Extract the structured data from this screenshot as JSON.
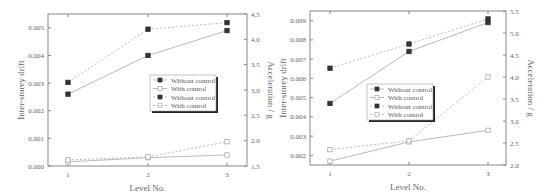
{
  "chart_data": [
    {
      "type": "line",
      "categories": [
        1,
        2,
        3
      ],
      "xlabel": "Level No.",
      "ylabel": "Inter-storey drift",
      "y2label": "Acceleration / g",
      "ylim": [
        0.0,
        0.0055
      ],
      "y2lim": [
        1.5,
        4.5
      ],
      "yticks": [
        "0.000",
        "0.001",
        "0.002",
        "0.003",
        "0.004",
        "0.005"
      ],
      "y2ticks": [
        "1.5",
        "2.0",
        "2.5",
        "3.0",
        "3.5",
        "4.0",
        "4.5"
      ],
      "xticks": [
        "1",
        "2",
        "3"
      ],
      "grid": false,
      "legend_position": "center-right",
      "series": [
        {
          "name": "Without control",
          "axis": "left",
          "style": "solid",
          "marker": "filled-square",
          "values": [
            0.0026,
            0.004,
            0.0049
          ]
        },
        {
          "name": "With control",
          "axis": "left",
          "style": "solid",
          "marker": "open-square",
          "values": [
            0.00015,
            0.0003,
            0.0004
          ]
        },
        {
          "name": "Without control",
          "axis": "right",
          "style": "dashed",
          "marker": "filled-square",
          "values": [
            3.15,
            4.2,
            4.33
          ]
        },
        {
          "name": "With control",
          "axis": "right",
          "style": "dashed",
          "marker": "open-square",
          "values": [
            1.62,
            1.68,
            1.98
          ]
        }
      ]
    },
    {
      "type": "line",
      "categories": [
        1,
        2,
        3
      ],
      "xlabel": "Level No.",
      "ylabel": "Inter-storey drift",
      "y2label": "Acceleration / g",
      "ylim": [
        0.0015,
        0.0095
      ],
      "y2lim": [
        2.0,
        5.5
      ],
      "yticks": [
        "0.002",
        "0.003",
        "0.004",
        "0.005",
        "0.006",
        "0.007",
        "0.008",
        "0.009"
      ],
      "y2ticks": [
        "2.0",
        "2.5",
        "3.0",
        "3.5",
        "4.0",
        "4.5",
        "5.0",
        "5.5"
      ],
      "xticks": [
        "1",
        "2",
        "3"
      ],
      "grid": false,
      "legend_position": "center",
      "series": [
        {
          "name": "Without control",
          "axis": "left",
          "style": "solid",
          "marker": "filled-square",
          "values": [
            0.0047,
            0.0074,
            0.0089
          ]
        },
        {
          "name": "With control",
          "axis": "left",
          "style": "solid",
          "marker": "open-square",
          "values": [
            0.0017,
            0.0027,
            0.0033
          ]
        },
        {
          "name": "Without control",
          "axis": "right",
          "style": "dashed",
          "marker": "filled-square",
          "values": [
            4.2,
            4.75,
            5.32
          ]
        },
        {
          "name": "With control",
          "axis": "right",
          "style": "dashed",
          "marker": "open-square",
          "values": [
            2.35,
            2.55,
            4.0
          ]
        }
      ]
    }
  ],
  "colors": {
    "axis": "#888888",
    "line": "#bbbbbb",
    "marker": "#333333",
    "text": "#666666"
  }
}
